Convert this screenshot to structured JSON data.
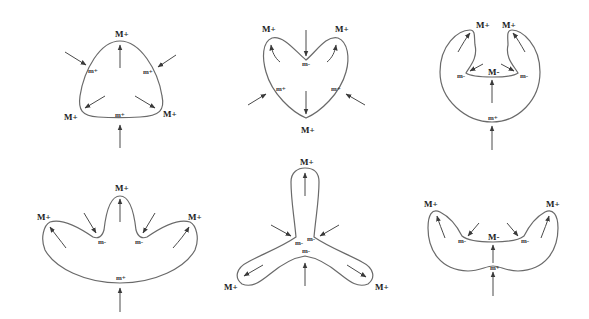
{
  "figure": {
    "type": "curvature-extrema shape evolution diagrams",
    "panels": [
      {
        "id": "panel-1",
        "shape": "rounded triangle",
        "labels": [
          {
            "text": "M+",
            "x": 120,
            "y": 38
          },
          {
            "text": "m+",
            "x": 90,
            "y": 72
          },
          {
            "text": "m+",
            "x": 146,
            "y": 74
          },
          {
            "text": "M+",
            "x": 68,
            "y": 117
          },
          {
            "text": "m+",
            "x": 119,
            "y": 117
          },
          {
            "text": "M+",
            "x": 166,
            "y": 117
          }
        ]
      },
      {
        "id": "panel-2",
        "shape": "heart",
        "labels": [
          {
            "text": "M+",
            "x": 266,
            "y": 30
          },
          {
            "text": "M+",
            "x": 343,
            "y": 30
          },
          {
            "text": "m-",
            "x": 306,
            "y": 66
          },
          {
            "text": "m+",
            "x": 280,
            "y": 91
          },
          {
            "text": "m+",
            "x": 336,
            "y": 91
          },
          {
            "text": "M+",
            "x": 305,
            "y": 132
          }
        ]
      },
      {
        "id": "panel-3",
        "shape": "horseshoe",
        "labels": [
          {
            "text": "M+",
            "x": 480,
            "y": 27
          },
          {
            "text": "M+",
            "x": 507,
            "y": 27
          },
          {
            "text": "m-",
            "x": 459,
            "y": 77
          },
          {
            "text": "M-",
            "x": 491,
            "y": 75
          },
          {
            "text": "m-",
            "x": 523,
            "y": 77
          },
          {
            "text": "m+",
            "x": 492,
            "y": 120
          }
        ]
      },
      {
        "id": "panel-4",
        "shape": "three-lobed crown",
        "labels": [
          {
            "text": "M+",
            "x": 121,
            "y": 190
          },
          {
            "text": "M+",
            "x": 44,
            "y": 219
          },
          {
            "text": "M+",
            "x": 192,
            "y": 219
          },
          {
            "text": "m-",
            "x": 100,
            "y": 243
          },
          {
            "text": "m-",
            "x": 137,
            "y": 243
          },
          {
            "text": "m+",
            "x": 120,
            "y": 279
          }
        ]
      },
      {
        "id": "panel-5",
        "shape": "three-armed propeller",
        "labels": [
          {
            "text": "M+",
            "x": 305,
            "y": 164
          },
          {
            "text": "m-",
            "x": 298,
            "y": 244
          },
          {
            "text": "m-",
            "x": 310,
            "y": 240
          },
          {
            "text": "m-",
            "x": 305,
            "y": 254
          },
          {
            "text": "M+",
            "x": 236,
            "y": 289
          },
          {
            "text": "M+",
            "x": 380,
            "y": 289
          }
        ]
      },
      {
        "id": "panel-6",
        "shape": "bilobed wing",
        "labels": [
          {
            "text": "M+",
            "x": 430,
            "y": 207
          },
          {
            "text": "M+",
            "x": 552,
            "y": 207
          },
          {
            "text": "m-",
            "x": 462,
            "y": 241
          },
          {
            "text": "M-",
            "x": 494,
            "y": 238
          },
          {
            "text": "m-",
            "x": 524,
            "y": 241
          },
          {
            "text": "m+",
            "x": 493,
            "y": 271
          }
        ]
      }
    ],
    "legend": {
      "M+": "positive curvature maximum",
      "M-": "negative curvature maximum",
      "m+": "positive curvature minimum",
      "m-": "negative curvature minimum"
    },
    "colors": {
      "curve": "#6a6a6a",
      "arrow": "#4a4a4a",
      "label": "#222222",
      "background": "#ffffff"
    }
  }
}
